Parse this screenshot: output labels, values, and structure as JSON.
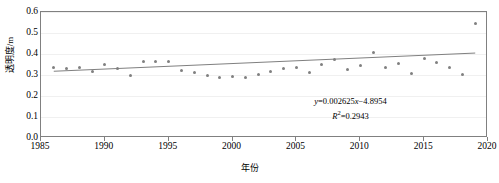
{
  "chart_data": {
    "type": "scatter",
    "title": "",
    "xlabel": "年份",
    "ylabel": "透明度/m",
    "xlim": [
      1985,
      2020
    ],
    "ylim": [
      0.0,
      0.6
    ],
    "xticks": [
      1985,
      1990,
      1995,
      2000,
      2005,
      2010,
      2015,
      2020
    ],
    "yticks": [
      "0.0",
      "0.1",
      "0.2",
      "0.3",
      "0.4",
      "0.5",
      "0.6"
    ],
    "grid": "horizontal",
    "legend": "none",
    "series": [
      {
        "name": "透明度",
        "marker": "circle",
        "color": "#808080",
        "x": [
          1986,
          1987,
          1988,
          1989,
          1990,
          1991,
          1992,
          1993,
          1994,
          1995,
          1996,
          1997,
          1998,
          1999,
          2000,
          2001,
          2002,
          2003,
          2004,
          2005,
          2006,
          2007,
          2008,
          2009,
          2010,
          2011,
          2012,
          2013,
          2014,
          2015,
          2016,
          2017,
          2018,
          2019
        ],
        "y": [
          0.335,
          0.333,
          0.335,
          0.318,
          0.351,
          0.333,
          0.296,
          0.365,
          0.366,
          0.366,
          0.322,
          0.313,
          0.297,
          0.288,
          0.295,
          0.29,
          0.304,
          0.318,
          0.33,
          0.338,
          0.31,
          0.35,
          0.372,
          0.326,
          0.346,
          0.408,
          0.334,
          0.355,
          0.309,
          0.378,
          0.36,
          0.336,
          0.301,
          0.543
        ]
      }
    ],
    "trendline": {
      "equation": "y=0.002625x−4.8954",
      "slope": 0.002625,
      "intercept": -4.8954,
      "r_squared_label": "R²=0.2943",
      "r_squared": 0.2943,
      "color": "#808080",
      "x_start": 1986,
      "x_end": 2019
    },
    "annotations": [
      {
        "line1": "y=0.002625x−4.8954",
        "line2": "R²=0.2943"
      }
    ]
  },
  "annotation": {
    "eq_y": "y",
    "eq_rest": "=0.002625",
    "eq_x": "x",
    "eq_tail": "−4.8954",
    "r_symbol": "R",
    "r_exp": "2",
    "r_value": "=0.2943"
  }
}
